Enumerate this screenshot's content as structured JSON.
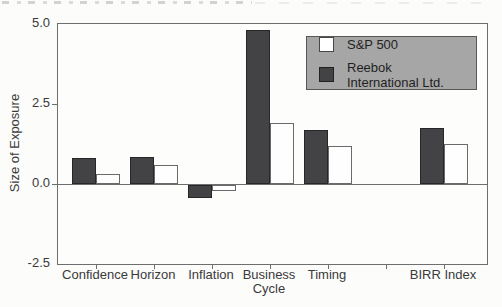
{
  "chart_data": {
    "type": "bar",
    "title": "",
    "ylabel": "Size of Exposure",
    "xlabel": "",
    "categories": [
      "Confidence",
      "Horizon",
      "Inflation",
      "Business\nCycle",
      "Timing",
      "BIRR Index"
    ],
    "category_slots": [
      0,
      1,
      2,
      3,
      4,
      6
    ],
    "n_slots": 7,
    "series": [
      {
        "name": "S&P 500",
        "fill": "#ffffff",
        "values": [
          0.3,
          0.6,
          -0.2,
          1.9,
          1.2,
          1.25
        ]
      },
      {
        "name": "Reebok International Ltd.",
        "fill": "#434346",
        "values": [
          0.8,
          0.85,
          -0.4,
          4.8,
          1.7,
          1.75
        ]
      }
    ],
    "ylim": [
      -2.5,
      5.0
    ],
    "yticks": [
      5.0,
      2.5,
      0.0,
      -2.5
    ],
    "ytick_labels": [
      "5.0",
      "2.5",
      "0.0",
      "-2.5"
    ],
    "grid": false,
    "zero_line": true,
    "legend_position": "top-right-inside",
    "legend_bg": "#a6a6a6",
    "bar_dark_color": "#434346",
    "bar_light_color": "#ffffff",
    "axis_color": "#6e6e6e"
  }
}
